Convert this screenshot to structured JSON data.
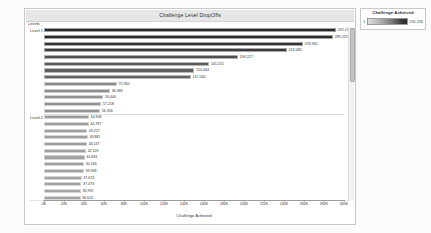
{
  "panel": {
    "title": "Challenge Level DropOffs"
  },
  "legend": {
    "title": "Challenge Achieved",
    "min": "1",
    "max": "292,196"
  },
  "axes": {
    "y_header": "Levels",
    "x_title": "Challenge Achieved",
    "x_ticks": [
      "0K",
      "20K",
      "40K",
      "60K",
      "80K",
      "100K",
      "120K",
      "140K",
      "160K",
      "180K",
      "200K",
      "220K",
      "240K",
      "260K",
      "280K",
      "300K"
    ]
  },
  "chart_data": {
    "type": "bar",
    "orientation": "horizontal",
    "title": "Challenge Level DropOffs",
    "xlabel": "Challenge Achieved",
    "ylabel": "Levels",
    "xlim": [
      0,
      300000
    ],
    "xtick_values": [
      0,
      20000,
      40000,
      60000,
      80000,
      100000,
      120000,
      140000,
      160000,
      180000,
      200000,
      220000,
      240000,
      260000,
      280000,
      300000
    ],
    "grid": false,
    "legend_position": "top-right",
    "color_scale": {
      "name": "Challenge Achieved",
      "min_value": 1,
      "max_value": 292196,
      "low_color": "#dddddd",
      "high_color": "#2b2b2b"
    },
    "groups": [
      {
        "label": "Level 1",
        "values": [
          292196,
          289255,
          258965,
          243080,
          194227,
          165215,
          150444,
          147030,
          72960,
          66380,
          59440,
          57218,
          56356
        ],
        "labels": [
          "292,196",
          "289,255",
          "258,965",
          "243,080",
          "194,227",
          "165,215",
          "150,444",
          "147,030",
          "72,960",
          "66,380",
          "59,440",
          "57,218",
          "56,356"
        ]
      },
      {
        "label": "Level 2",
        "values": [
          44908,
          44787,
          43227,
          43881,
          43137,
          42126,
          40833,
          40166,
          39948,
          37674,
          37473,
          36992,
          36614
        ],
        "labels": [
          "44,908",
          "44,787",
          "43,227",
          "43,881",
          "43,137",
          "42,126",
          "40,833",
          "40,166",
          "39,948",
          "37,674",
          "37,473",
          "36,992",
          "36,614"
        ]
      }
    ]
  }
}
